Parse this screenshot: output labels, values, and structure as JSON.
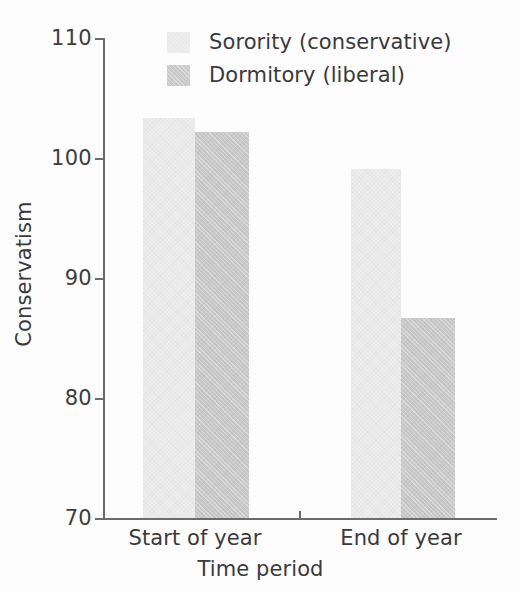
{
  "chart_data": {
    "type": "bar",
    "title": "",
    "xlabel": "Time period",
    "ylabel": "Conservatism",
    "categories": [
      "Start of year",
      "End of year"
    ],
    "series": [
      {
        "name": "Sorority (conservative)",
        "color": "#ededed",
        "values": [
          103.3,
          99.1
        ]
      },
      {
        "name": "Dormitory (liberal)",
        "color": "#c9c9c9",
        "values": [
          102.2,
          86.7
        ]
      }
    ],
    "ylim": [
      70,
      110
    ],
    "yticks": [
      70,
      80,
      90,
      100,
      110
    ],
    "ytick_labels": [
      "70",
      "80",
      "90",
      "100",
      "110"
    ],
    "grid": false,
    "legend_position": "top-center",
    "bar_grouping": "adjacent-touching"
  },
  "axes": {
    "y_label": "Conservatism",
    "x_label": "Time period",
    "y_ticks": [
      "110",
      "100",
      "90",
      "80",
      "70"
    ],
    "x_ticks": [
      "Start of year",
      "End of year"
    ]
  },
  "legend": {
    "entries": [
      {
        "label": "Sorority (conservative)",
        "swatch": "light-gray-swatch"
      },
      {
        "label": "Dormitory (liberal)",
        "swatch": "medium-gray-swatch"
      }
    ]
  },
  "colors": {
    "series_a": "#ededed",
    "series_b": "#c9c9c9",
    "axis": "#6b6b6b",
    "text": "#3a3a3a",
    "background": "#fdfdfd"
  }
}
